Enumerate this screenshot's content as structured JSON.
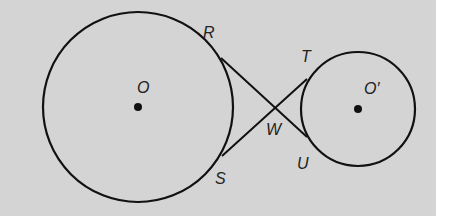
{
  "diagram": {
    "background": "#d4d4d4",
    "stroke": "#111111",
    "circles": [
      {
        "name": "O",
        "label": "O",
        "cx": 138,
        "cy": 107,
        "r": 95
      },
      {
        "name": "O'",
        "label": "O′",
        "cx": 358,
        "cy": 109,
        "r": 57
      }
    ],
    "points": {
      "R": {
        "label": "R",
        "x": 221,
        "y": 58
      },
      "S": {
        "label": "S",
        "x": 222,
        "y": 156
      },
      "T": {
        "label": "T",
        "x": 307,
        "y": 79
      },
      "U": {
        "label": "U",
        "x": 307,
        "y": 137
      },
      "W": {
        "label": "W",
        "x": 275,
        "y": 108
      }
    },
    "segments": [
      [
        "R",
        "U"
      ],
      [
        "S",
        "T"
      ]
    ]
  }
}
